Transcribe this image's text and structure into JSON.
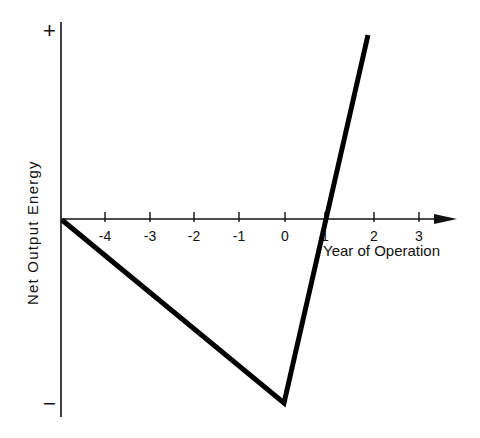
{
  "chart_data": {
    "type": "line",
    "title": "",
    "xlabel": "Year of Operation",
    "ylabel": "Net Output Energy",
    "x_ticks": [
      "-4",
      "-3",
      "-2",
      "-1",
      "0",
      "1",
      "2",
      "3"
    ],
    "y_ticks": [
      "+",
      "−"
    ],
    "series": [
      {
        "name": "Net Output Energy",
        "x": [
          -5,
          0,
          1,
          1.9
        ],
        "y": [
          0,
          -1,
          0,
          1
        ],
        "note": "Declines linearly from 0 at year -5 to minimum at year 0, crosses zero near year 1, rising steeply to '+' near year 2"
      }
    ],
    "xlim": [
      -5,
      3.5
    ],
    "ylim": [
      -1,
      1
    ],
    "grid": false,
    "legend": "none"
  },
  "labels": {
    "plus": "+",
    "minus": "−",
    "y_axis_title": "Net Output Energy",
    "x_axis_title": "Year of Operation",
    "ticks": [
      "-4",
      "-3",
      "-2",
      "-1",
      "0",
      "1",
      "2",
      "3"
    ]
  }
}
